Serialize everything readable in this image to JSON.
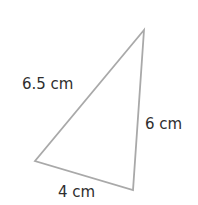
{
  "diagram": {
    "type": "triangle",
    "stroke_color": "#a9a9a9",
    "text_color": "#2e2e2e",
    "vertices": {
      "top": [
        144,
        30
      ],
      "bottom_left": [
        35,
        161
      ],
      "bottom_right": [
        133,
        190
      ]
    },
    "labels": {
      "hypotenuse": "6.5 cm",
      "right_side": "6 cm",
      "bottom_side": "4 cm"
    }
  }
}
